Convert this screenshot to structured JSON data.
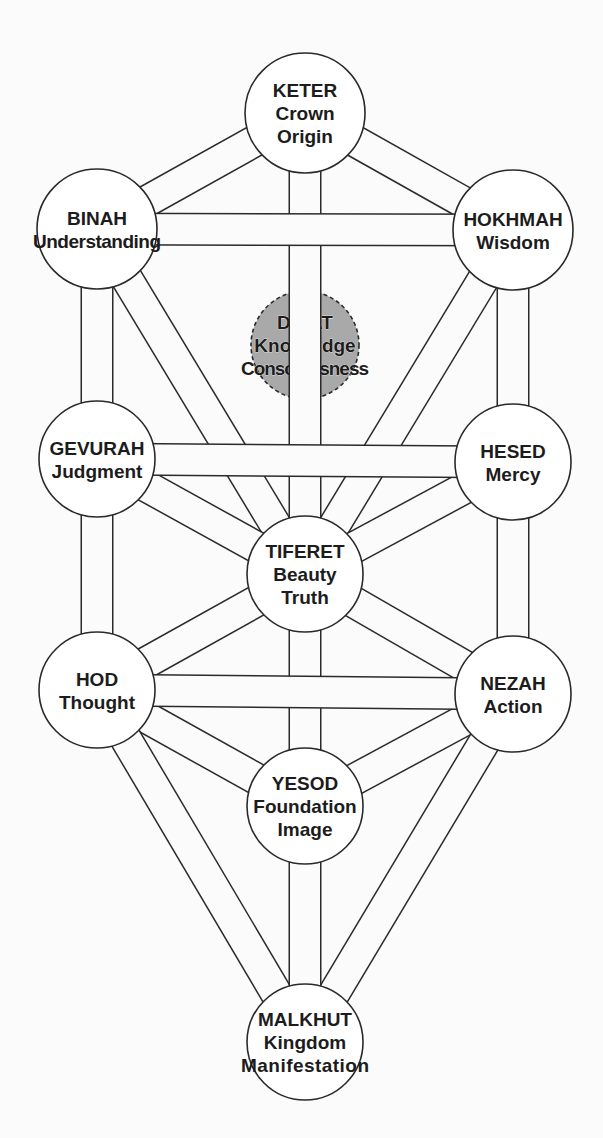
{
  "diagram": {
    "type": "tree-of-life",
    "colors": {
      "background": "#fbfbfb",
      "line": "#2a2a2a",
      "node_fill": "#ffffff",
      "hidden_node_fill": "#a9a9a9",
      "text": "#1c1c1c"
    },
    "channel_width": 30,
    "nodes": [
      {
        "id": "keter",
        "lines": [
          "KETER",
          "Crown",
          "Origin"
        ],
        "cx": 305,
        "cy": 113,
        "r": 60,
        "hidden": false
      },
      {
        "id": "binah",
        "lines": [
          "BINAH",
          "Understanding"
        ],
        "cx": 97,
        "cy": 229,
        "r": 60,
        "hidden": false
      },
      {
        "id": "hokhmah",
        "lines": [
          "HOKHMAH",
          "Wisdom"
        ],
        "cx": 513,
        "cy": 230,
        "r": 60,
        "hidden": false
      },
      {
        "id": "daat",
        "lines": [
          "DA'AT",
          "Knowledge",
          "Consciousness"
        ],
        "cx": 305,
        "cy": 345,
        "r": 54,
        "hidden": true
      },
      {
        "id": "gevurah",
        "lines": [
          "GEVURAH",
          "Judgment"
        ],
        "cx": 97,
        "cy": 459,
        "r": 58,
        "hidden": false
      },
      {
        "id": "hesed",
        "lines": [
          "HESED",
          "Mercy"
        ],
        "cx": 513,
        "cy": 462,
        "r": 58,
        "hidden": false
      },
      {
        "id": "tiferet",
        "lines": [
          "TIFERET",
          "Beauty",
          "Truth"
        ],
        "cx": 305,
        "cy": 574,
        "r": 58,
        "hidden": false
      },
      {
        "id": "hod",
        "lines": [
          "HOD",
          "Thought"
        ],
        "cx": 97,
        "cy": 690,
        "r": 58,
        "hidden": false
      },
      {
        "id": "nezah",
        "lines": [
          "NEZAH",
          "Action"
        ],
        "cx": 513,
        "cy": 694,
        "r": 58,
        "hidden": false
      },
      {
        "id": "yesod",
        "lines": [
          "YESOD",
          "Foundation",
          "Image"
        ],
        "cx": 305,
        "cy": 806,
        "r": 58,
        "hidden": false
      },
      {
        "id": "malkhut",
        "lines": [
          "MALKHUT",
          "Kingdom",
          "Manifestation"
        ],
        "cx": 305,
        "cy": 1042,
        "r": 58,
        "hidden": false
      }
    ],
    "paths": {
      "diagonal": [
        [
          "keter",
          "binah"
        ],
        [
          "keter",
          "hokhmah"
        ],
        [
          "binah",
          "tiferet"
        ],
        [
          "hokhmah",
          "tiferet"
        ],
        [
          "gevurah",
          "tiferet"
        ],
        [
          "hesed",
          "tiferet"
        ],
        [
          "tiferet",
          "hod"
        ],
        [
          "tiferet",
          "nezah"
        ],
        [
          "hod",
          "yesod"
        ],
        [
          "nezah",
          "yesod"
        ],
        [
          "hod",
          "malkhut"
        ],
        [
          "nezah",
          "malkhut"
        ]
      ],
      "vertical": [
        [
          "keter",
          "tiferet"
        ],
        [
          "tiferet",
          "yesod"
        ],
        [
          "yesod",
          "malkhut"
        ],
        [
          "binah",
          "gevurah"
        ],
        [
          "gevurah",
          "hod"
        ],
        [
          "hokhmah",
          "hesed"
        ],
        [
          "hesed",
          "nezah"
        ]
      ],
      "horizontal": [
        [
          "binah",
          "hokhmah"
        ],
        [
          "gevurah",
          "hesed"
        ],
        [
          "hod",
          "nezah"
        ]
      ]
    }
  }
}
